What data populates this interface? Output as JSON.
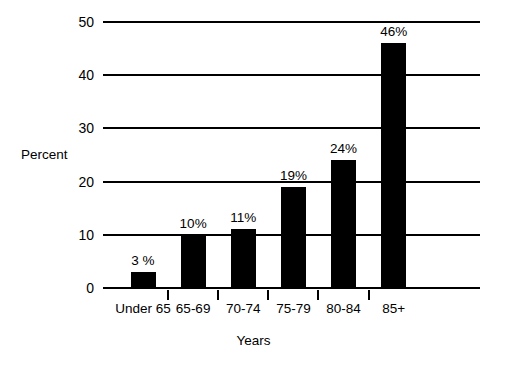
{
  "chart_data": {
    "type": "bar",
    "title": "",
    "subtitle": "",
    "xlabel": "Years",
    "ylabel": "Percent",
    "categories": [
      "Under 65",
      "65-69",
      "70-74",
      "75-79",
      "80-84",
      "85+"
    ],
    "values": [
      3,
      10,
      11,
      19,
      24,
      46
    ],
    "data_labels": [
      "3 %",
      "10%",
      "11%",
      "19%",
      "24%",
      "46%"
    ],
    "ylim": [
      0,
      50
    ],
    "y_ticks": [
      0,
      10,
      20,
      30,
      40,
      50
    ],
    "y_tick_labels": [
      "0",
      "10",
      "20",
      "30",
      "40",
      "50"
    ],
    "grid": "horizontal",
    "legend": "none",
    "series": [
      {
        "name": "Percent",
        "values": [
          3,
          10,
          11,
          19,
          24,
          46
        ],
        "color": "#000000"
      }
    ],
    "colors": {
      "bar": "#000000",
      "axis": "#000000",
      "grid": "#000000",
      "text": "#000000",
      "background": "#ffffff"
    }
  }
}
